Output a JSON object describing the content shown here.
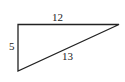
{
  "diagram": {
    "type": "right-triangle",
    "vertices": {
      "top_left": [
        18,
        24.5
      ],
      "bottom_left": [
        18,
        71
      ],
      "right": [
        119,
        24.5
      ]
    },
    "sides": {
      "vertical": {
        "label": "5"
      },
      "top": {
        "label": "12"
      },
      "hypotenuse": {
        "label": "13"
      }
    },
    "stroke_color": "#222222",
    "background": "#ffffff"
  }
}
